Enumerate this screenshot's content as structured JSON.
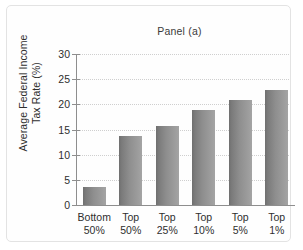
{
  "chart_data": {
    "type": "bar",
    "title": "Panel (a)",
    "xlabel": "",
    "ylabel": "Average Federal Income Tax Rate (%)",
    "ylabel_lines": [
      "Average Federal Income",
      "Tax Rate (%)"
    ],
    "categories": [
      "Bottom 50%",
      "Top 50%",
      "Top 25%",
      "Top 10%",
      "Top 5%",
      "Top 1%"
    ],
    "category_lines": [
      [
        "Bottom",
        "50%"
      ],
      [
        "Top",
        "50%"
      ],
      [
        "Top",
        "25%"
      ],
      [
        "Top",
        "10%"
      ],
      [
        "Top",
        "5%"
      ],
      [
        "Top",
        "1%"
      ]
    ],
    "values": [
      3.5,
      13.7,
      15.7,
      18.9,
      20.9,
      22.9
    ],
    "ylim": [
      0,
      30
    ],
    "yticks": [
      30,
      25,
      20,
      15,
      10,
      5,
      0
    ],
    "ytick_labels": [
      "30",
      "25",
      "20",
      "15",
      "10",
      "5",
      "0"
    ],
    "grid": true,
    "grid_axis": "y",
    "legend": false,
    "bar_color": "#8e8e8e",
    "grid_color": "#cfcfcf",
    "axis_color": "#8e8e8e",
    "text_color": "#2e2e2e",
    "background": "#fefefe"
  }
}
